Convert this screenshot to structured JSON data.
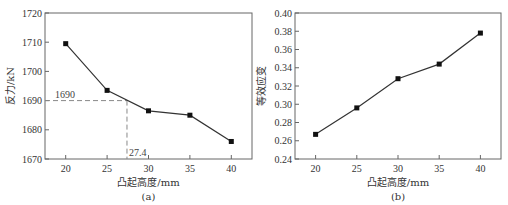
{
  "chart_data": [
    {
      "type": "line",
      "panel_label": "(a)",
      "xlabel": "凸起高度/mm",
      "ylabel": "反力/kN",
      "x": [
        20,
        25,
        30,
        35,
        40
      ],
      "series": [
        {
          "name": "反力",
          "values": [
            1709.5,
            1693.5,
            1686.5,
            1685,
            1676
          ],
          "marker": "square"
        }
      ],
      "xlim": [
        17.5,
        42.5
      ],
      "ylim": [
        1670,
        1720
      ],
      "xticks": [
        20,
        25,
        30,
        35,
        40
      ],
      "yticks": [
        1670,
        1680,
        1690,
        1700,
        1710,
        1720
      ],
      "annotations": [
        {
          "type": "hline-dashed",
          "y": 1690,
          "x_to": 27.4,
          "label": "1690"
        },
        {
          "type": "vline-dashed",
          "x": 27.4,
          "y_to": 1690,
          "label": "27.4"
        }
      ],
      "grid": false
    },
    {
      "type": "line",
      "panel_label": "(b)",
      "xlabel": "凸起高度/mm",
      "ylabel": "等效应变",
      "x": [
        20,
        25,
        30,
        35,
        40
      ],
      "series": [
        {
          "name": "等效应变",
          "values": [
            0.267,
            0.296,
            0.328,
            0.344,
            0.378
          ],
          "marker": "square"
        }
      ],
      "xlim": [
        17.5,
        42.5
      ],
      "ylim": [
        0.24,
        0.4
      ],
      "xticks": [
        20,
        25,
        30,
        35,
        40
      ],
      "yticks": [
        "0.24",
        "0.26",
        "0.28",
        "0.30",
        "0.32",
        "0.34",
        "0.36",
        "0.38",
        "0.40"
      ],
      "grid": false
    }
  ],
  "colors": {
    "axis": "#666666",
    "line": "#333333",
    "marker": "#111111",
    "dash": "#888888"
  }
}
